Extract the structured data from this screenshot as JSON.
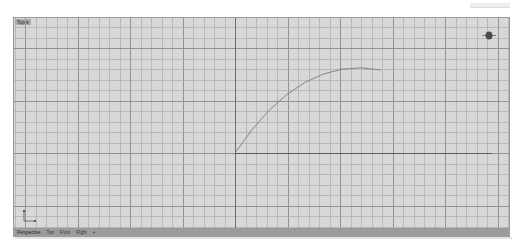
{
  "viewport": {
    "label": "Top ▾",
    "name": "Top",
    "background": "#d8d8d8",
    "grid": {
      "minor_spacing_px": 10.5,
      "major_every": 5,
      "minor_color": "#a5a5a5",
      "major_color": "#8a8a8a",
      "axis_color": "#6a6a6a"
    },
    "curve": {
      "start": [
        221,
        135
      ],
      "end": [
        367,
        52
      ],
      "color": "#7a7a7a"
    },
    "x_axis_line": {
      "y": 135,
      "x_from": 221,
      "x_to": 478,
      "color": "#5a5a5a"
    },
    "axis_icon": {
      "x_label": "x",
      "y_label": "y"
    },
    "gumball_icon": "navigation-gumball"
  },
  "tabs": [
    {
      "label": "Perspective",
      "active": true
    },
    {
      "label": "Top",
      "active": false
    },
    {
      "label": "Front",
      "active": false
    },
    {
      "label": "Right",
      "active": false
    },
    {
      "label": "+",
      "active": false
    }
  ]
}
